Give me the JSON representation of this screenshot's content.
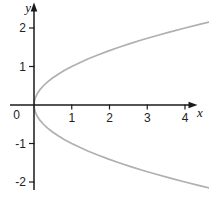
{
  "figure": {
    "background": "#ffffff"
  },
  "chart_data": {
    "type": "line",
    "title": "",
    "equation": "y^2 = x (sideways parabola, opens right, vertex at origin)",
    "xlabel": "x",
    "ylabel": "y",
    "origin_label": "0",
    "x_ticks": {
      "values": [
        1,
        2,
        3,
        4
      ],
      "labels": [
        "1",
        "2",
        "3",
        "4"
      ]
    },
    "y_ticks": {
      "values": [
        -2,
        -1,
        1,
        2
      ],
      "labels": [
        "-2",
        "-1",
        "1",
        "2"
      ]
    },
    "xlim": [
      -0.65,
      4.65
    ],
    "ylim": [
      -2.3,
      2.65
    ],
    "grid": false,
    "legend": "none",
    "colors": {
      "curve": "#b0b0b0",
      "axis": "#1a1a1a",
      "tick_label": "#222222"
    },
    "series": [
      {
        "name": "upper branch y = sqrt(x)",
        "points": [
          [
            0,
            0
          ],
          [
            0.01,
            0.1
          ],
          [
            0.04,
            0.2
          ],
          [
            0.09,
            0.3
          ],
          [
            0.16,
            0.4
          ],
          [
            0.25,
            0.5
          ],
          [
            0.36,
            0.6
          ],
          [
            0.49,
            0.7
          ],
          [
            0.64,
            0.8
          ],
          [
            0.81,
            0.9
          ],
          [
            1,
            1
          ],
          [
            1.21,
            1.1
          ],
          [
            1.44,
            1.2
          ],
          [
            1.69,
            1.3
          ],
          [
            1.96,
            1.4
          ],
          [
            2.25,
            1.5
          ],
          [
            2.56,
            1.6
          ],
          [
            2.89,
            1.7
          ],
          [
            3.24,
            1.8
          ],
          [
            3.61,
            1.9
          ],
          [
            4,
            2
          ],
          [
            4.41,
            2.1
          ],
          [
            4.84,
            2.2
          ]
        ]
      },
      {
        "name": "lower branch y = -sqrt(x)",
        "points": [
          [
            0,
            0
          ],
          [
            0.01,
            -0.1
          ],
          [
            0.04,
            -0.2
          ],
          [
            0.09,
            -0.3
          ],
          [
            0.16,
            -0.4
          ],
          [
            0.25,
            -0.5
          ],
          [
            0.36,
            -0.6
          ],
          [
            0.49,
            -0.7
          ],
          [
            0.64,
            -0.8
          ],
          [
            0.81,
            -0.9
          ],
          [
            1,
            -1
          ],
          [
            1.21,
            -1.1
          ],
          [
            1.44,
            -1.2
          ],
          [
            1.69,
            -1.3
          ],
          [
            1.96,
            -1.4
          ],
          [
            2.25,
            -1.5
          ],
          [
            2.56,
            -1.6
          ],
          [
            2.89,
            -1.7
          ],
          [
            3.24,
            -1.8
          ],
          [
            3.61,
            -1.9
          ],
          [
            4,
            -2
          ],
          [
            4.41,
            -2.1
          ],
          [
            4.84,
            -2.2
          ]
        ]
      }
    ]
  }
}
